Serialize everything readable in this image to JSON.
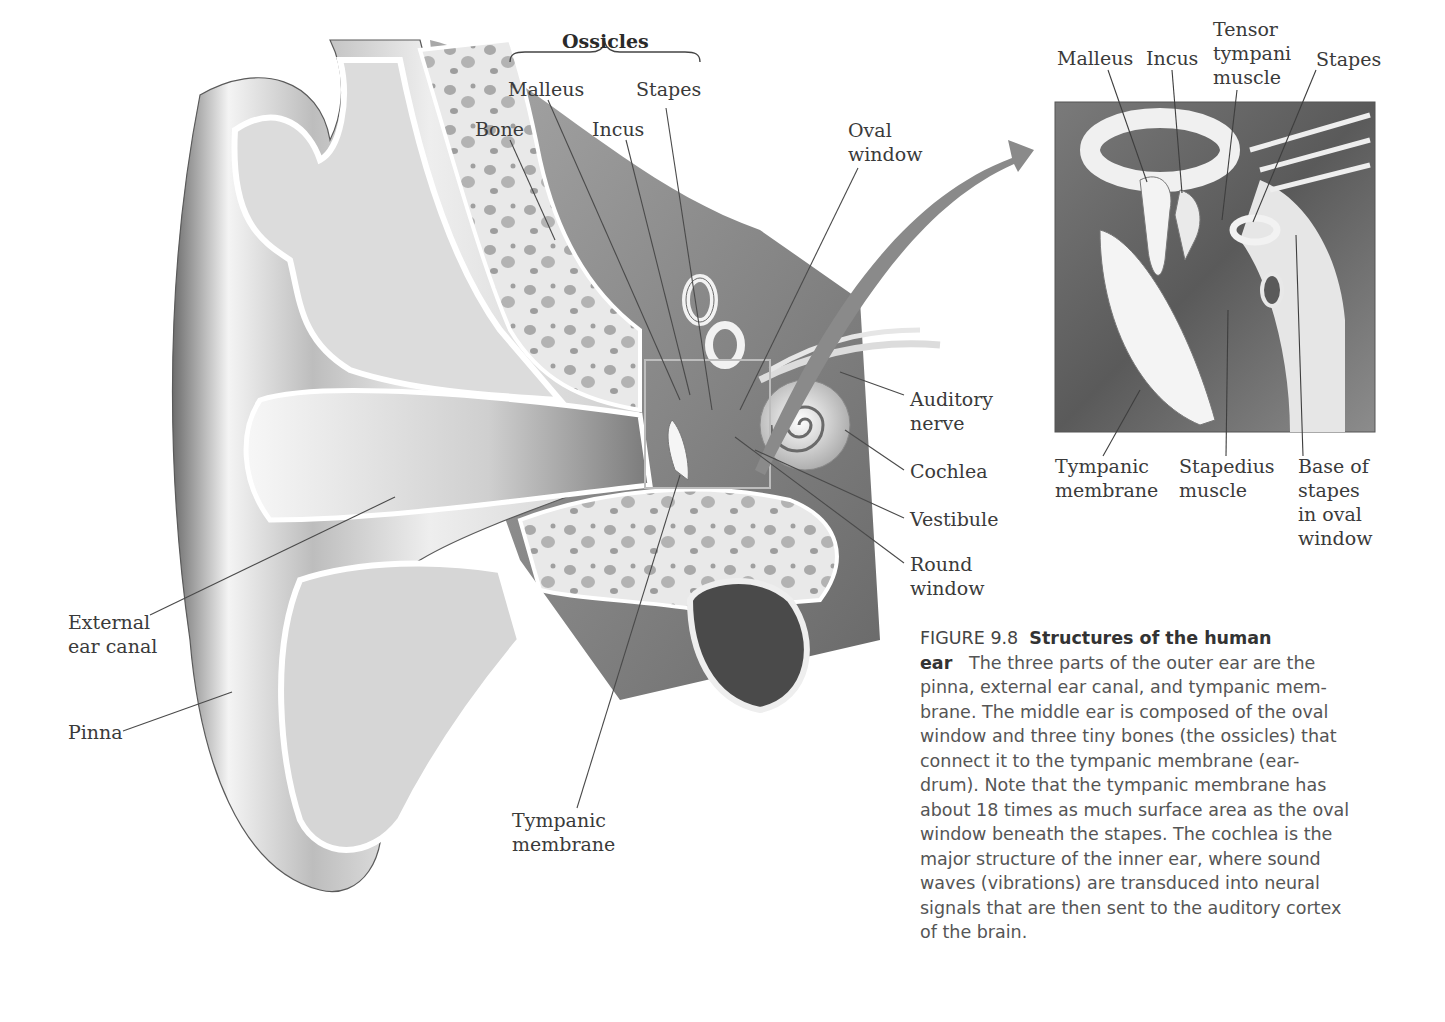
{
  "figure": {
    "number": "FIGURE 9.8",
    "title": "Structures of the human ear",
    "title_line1": "Structures of the human",
    "title_line2": "ear",
    "caption_lines": [
      "The three parts of the outer ear are the",
      "pinna, external ear canal, and tympanic mem-",
      "brane. The middle ear is composed of the oval",
      "window and three tiny bones (the ossicles) that",
      "connect it to the tympanic membrane (ear-",
      "drum). Note that the tympanic membrane has",
      "about 18 times as much surface area as the oval",
      "window beneath the stapes. The cochlea is the",
      "major structure of the inner ear, where sound",
      "waves (vibrations) are transduced into neural",
      "signals that are then sent to the auditory cortex",
      "of the brain."
    ]
  },
  "main_diagram": {
    "labels": {
      "ossicles": "Ossicles",
      "malleus": "Malleus",
      "stapes": "Stapes",
      "bone": "Bone",
      "incus": "Incus",
      "oval_window": "Oval\nwindow",
      "auditory_nerve": "Auditory\nnerve",
      "cochlea": "Cochlea",
      "vestibule": "Vestibule",
      "round_window": "Round\nwindow",
      "external_ear_canal": "External\near canal",
      "pinna": "Pinna",
      "tympanic_membrane": "Tympanic\nmembrane"
    }
  },
  "inset_diagram": {
    "labels": {
      "malleus": "Malleus",
      "incus": "Incus",
      "tensor_tympani": "Tensor\ntympani\nmuscle",
      "stapes": "Stapes",
      "tympanic_membrane": "Tympanic\nmembrane",
      "stapedius_muscle": "Stapedius\nmuscle",
      "base_of_stapes": "Base of\nstapes\nin oval\nwindow"
    }
  },
  "colors": {
    "label_text": "#3a3a3a",
    "caption_text": "#555555",
    "arrow": "#8a8a8a",
    "leader_line": "#555555"
  }
}
